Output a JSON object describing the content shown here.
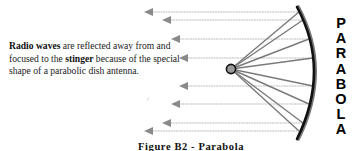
{
  "description": {
    "term1": "Radio waves",
    "text1": " are reflected away from and focused to the ",
    "term2": "stinger",
    "text2": " because of the special shape of a parabolic dish antenna."
  },
  "vertical_title": {
    "letters": [
      "P",
      "A",
      "R",
      "A",
      "B",
      "O",
      "L",
      "A"
    ]
  },
  "caption": "Figure B2 - Parabola",
  "stray_mark": "/",
  "colors": {
    "arrow": "#8a8a8a",
    "ray": "#7a7a7a",
    "dish": "#111111",
    "focus_fill": "#9a9a9a",
    "text": "#222222"
  },
  "diagram": {
    "focus": {
      "x": 231,
      "y": 69,
      "r": 5
    },
    "dish_arc": {
      "top": [
        298,
        7
      ],
      "mid": [
        314,
        70
      ],
      "bottom": [
        297,
        139
      ]
    },
    "arrows": [
      {
        "y": 12,
        "tip_x": 144
      },
      {
        "y": 20,
        "tip_x": 162
      },
      {
        "y": 39,
        "tip_x": 171
      },
      {
        "y": 58,
        "tip_x": 179
      },
      {
        "y": 86,
        "tip_x": 179
      },
      {
        "y": 104,
        "tip_x": 171
      },
      {
        "y": 123,
        "tip_x": 162
      },
      {
        "y": 131,
        "tip_x": 144
      }
    ]
  }
}
